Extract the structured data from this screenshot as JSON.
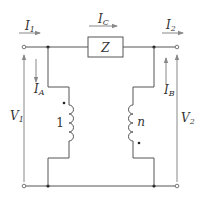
{
  "diagram": {
    "title": "",
    "colors": {
      "wire": "#555555",
      "arrow": "#888888",
      "text": "#333333"
    },
    "currents": {
      "I1": {
        "main": "I",
        "sub": "1"
      },
      "IC": {
        "main": "I",
        "sub": "C"
      },
      "I2": {
        "main": "I",
        "sub": "2"
      },
      "IA": {
        "main": "I",
        "sub": "A"
      },
      "IB": {
        "main": "I",
        "sub": "B"
      }
    },
    "voltages": {
      "V1": {
        "main": "V",
        "sub": "1"
      },
      "V2": {
        "main": "V",
        "sub": "2"
      }
    },
    "impedance": {
      "label": "Z"
    },
    "coils": {
      "left": {
        "turns_label": "1",
        "dot": "top"
      },
      "right": {
        "turns_label": "n",
        "dot": "bottom"
      }
    }
  }
}
